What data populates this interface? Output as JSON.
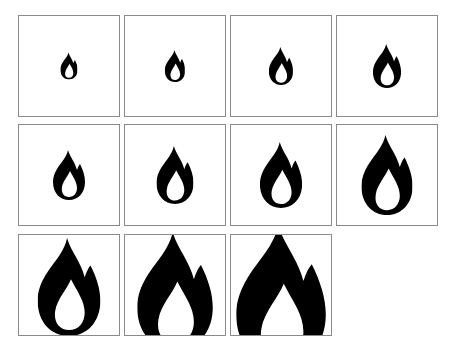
{
  "grid": {
    "columns": 4,
    "rows": 3,
    "cell_size": 102,
    "border_color": "#8a8a8a",
    "icon_color": "#000000",
    "icon": "flame-icon",
    "cells": [
      {
        "index": 1,
        "x": 18,
        "y": 15,
        "flame_height": 27
      },
      {
        "index": 2,
        "x": 124,
        "y": 15,
        "flame_height": 32
      },
      {
        "index": 3,
        "x": 230,
        "y": 15,
        "flame_height": 38
      },
      {
        "index": 4,
        "x": 336,
        "y": 15,
        "flame_height": 44
      },
      {
        "index": 5,
        "x": 18,
        "y": 124,
        "flame_height": 50
      },
      {
        "index": 6,
        "x": 124,
        "y": 124,
        "flame_height": 58
      },
      {
        "index": 7,
        "x": 230,
        "y": 124,
        "flame_height": 66
      },
      {
        "index": 8,
        "x": 336,
        "y": 124,
        "flame_height": 80
      },
      {
        "index": 9,
        "x": 18,
        "y": 234,
        "flame_height": 98
      },
      {
        "index": 10,
        "x": 124,
        "y": 234,
        "flame_height": 118
      },
      {
        "index": 11,
        "x": 230,
        "y": 234,
        "flame_height": 140
      }
    ]
  }
}
